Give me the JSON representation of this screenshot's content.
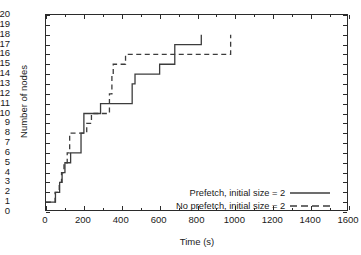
{
  "chart_data": {
    "type": "line",
    "title": "",
    "xlabel": "Time (s)",
    "ylabel": "Number of nodes",
    "xlim": [
      0,
      1600
    ],
    "ylim": [
      0,
      20
    ],
    "xticks": [
      0,
      200,
      400,
      600,
      800,
      1000,
      1200,
      1400,
      1600
    ],
    "yticks": [
      0,
      1,
      2,
      3,
      4,
      5,
      6,
      7,
      8,
      9,
      10,
      11,
      12,
      13,
      14,
      15,
      16,
      17,
      18,
      19,
      20
    ],
    "grid": false,
    "legend_position": "lower right",
    "step_style": "post",
    "series": [
      {
        "name": "Prefetch, initial size = 2",
        "style": "solid",
        "color": "#3c3c3c",
        "points": [
          [
            0,
            1
          ],
          [
            50,
            1
          ],
          [
            50,
            2
          ],
          [
            72,
            2
          ],
          [
            72,
            3
          ],
          [
            85,
            3
          ],
          [
            85,
            4
          ],
          [
            100,
            4
          ],
          [
            100,
            5
          ],
          [
            130,
            5
          ],
          [
            130,
            6
          ],
          [
            185,
            6
          ],
          [
            185,
            8
          ],
          [
            200,
            8
          ],
          [
            200,
            10
          ],
          [
            288,
            10
          ],
          [
            288,
            11
          ],
          [
            330,
            11
          ],
          [
            330,
            11
          ],
          [
            455,
            11
          ],
          [
            455,
            13
          ],
          [
            470,
            13
          ],
          [
            470,
            14
          ],
          [
            600,
            14
          ],
          [
            600,
            15
          ],
          [
            680,
            15
          ],
          [
            680,
            17
          ],
          [
            820,
            17
          ],
          [
            820,
            18
          ]
        ]
      },
      {
        "name": "No prefetch, initial size = 2",
        "style": "dashed",
        "color": "#3c3c3c",
        "points": [
          [
            0,
            1
          ],
          [
            48,
            1
          ],
          [
            48,
            2
          ],
          [
            70,
            2
          ],
          [
            70,
            3
          ],
          [
            82,
            3
          ],
          [
            82,
            4
          ],
          [
            95,
            4
          ],
          [
            95,
            5
          ],
          [
            112,
            5
          ],
          [
            112,
            6
          ],
          [
            125,
            6
          ],
          [
            125,
            8
          ],
          [
            215,
            8
          ],
          [
            215,
            9
          ],
          [
            240,
            9
          ],
          [
            240,
            10
          ],
          [
            335,
            10
          ],
          [
            335,
            12
          ],
          [
            348,
            12
          ],
          [
            348,
            14
          ],
          [
            355,
            14
          ],
          [
            355,
            15
          ],
          [
            420,
            15
          ],
          [
            420,
            16
          ],
          [
            975,
            16
          ],
          [
            975,
            18
          ]
        ]
      }
    ]
  }
}
